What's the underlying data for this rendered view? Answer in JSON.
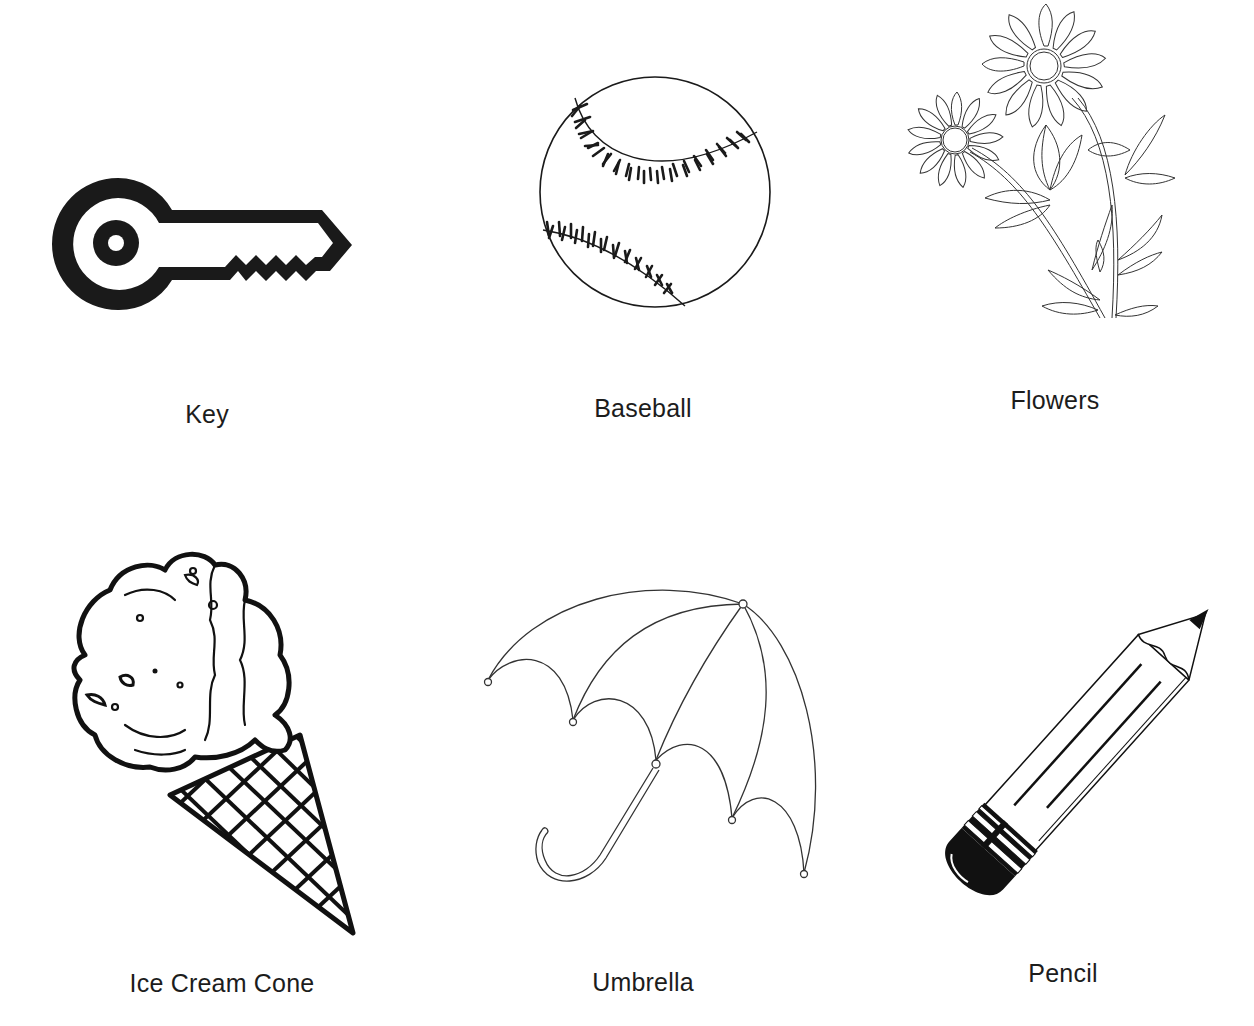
{
  "page": {
    "background": "#ffffff",
    "ink": "#1a1a1a"
  },
  "items": [
    {
      "id": "key",
      "label": "Key",
      "icon": "key-icon"
    },
    {
      "id": "baseball",
      "label": "Baseball",
      "icon": "baseball-icon"
    },
    {
      "id": "flowers",
      "label": "Flowers",
      "icon": "flowers-icon"
    },
    {
      "id": "ice-cream-cone",
      "label": "Ice Cream Cone",
      "icon": "ice-cream-cone-icon"
    },
    {
      "id": "umbrella",
      "label": "Umbrella",
      "icon": "umbrella-icon"
    },
    {
      "id": "pencil",
      "label": "Pencil",
      "icon": "pencil-icon"
    }
  ]
}
